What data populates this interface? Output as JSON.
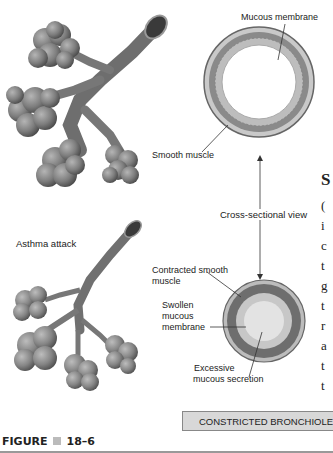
{
  "labels": {
    "mucous_membrane": "Mucous membrane",
    "smooth_muscle": "Smooth muscle",
    "cross_sectional_view": "Cross-sectional view",
    "asthma_attack": "Asthma attack",
    "contracted_smooth_muscle_1": "Contracted smooth",
    "contracted_smooth_muscle_2": "muscle",
    "swollen_1": "Swollen",
    "swollen_2": "mucous",
    "swollen_3": "membrane",
    "excessive_1": "Excessive",
    "excessive_2": "mucous secretion"
  },
  "caption_box": "CONSTRICTED BRONCHIOLE",
  "figure": {
    "prefix": "FIGURE",
    "number": "18–6"
  },
  "side_text_fragments": [
    "S",
    "(",
    "i",
    "c",
    "t",
    "g",
    "t",
    "r",
    "a",
    "t",
    "t"
  ],
  "colors": {
    "illustration_gray": "#7a7a7a",
    "caption_bg": "#d8d8d8"
  }
}
